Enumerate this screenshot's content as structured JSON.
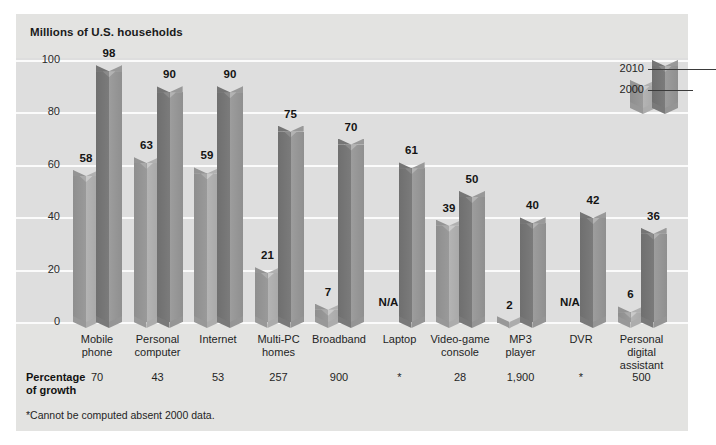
{
  "chart_data": {
    "type": "bar",
    "title": "Millions of U.S. households",
    "xlabel": "",
    "ylabel": "Millions of U.S. households",
    "ylim": [
      0,
      100
    ],
    "yticks": [
      0,
      20,
      40,
      60,
      80,
      100
    ],
    "grid": true,
    "legend_position": "top-right",
    "categories": [
      "Mobile\nphone",
      "Personal\ncomputer",
      "Internet",
      "Multi-PC\nhomes",
      "Broadband",
      "Laptop",
      "Video-game\nconsole",
      "MP3\nplayer",
      "DVR",
      "Personal\ndigital\nassistant"
    ],
    "series": [
      {
        "name": "2000",
        "values": [
          58,
          63,
          59,
          21,
          7,
          null,
          39,
          2,
          null,
          6
        ],
        "labels": [
          "58",
          "63",
          "59",
          "21",
          "7",
          "N/A",
          "39",
          "2",
          "N/A",
          "6"
        ]
      },
      {
        "name": "2010",
        "values": [
          98,
          90,
          90,
          75,
          70,
          61,
          50,
          40,
          42,
          36
        ],
        "labels": [
          "98",
          "90",
          "90",
          "75",
          "70",
          "61",
          "50",
          "40",
          "42",
          "36"
        ]
      }
    ],
    "growth_row_label": "Percentage\nof growth",
    "growth_values": [
      "70",
      "43",
      "53",
      "257",
      "900",
      "*",
      "28",
      "1,900",
      "*",
      "500"
    ],
    "footnote": "*Cannot be computed absent 2000 data."
  },
  "legend": {
    "items": [
      {
        "label": "2010",
        "series": "2010"
      },
      {
        "label": "2000",
        "series": "2000"
      }
    ]
  },
  "colors": {
    "panel_bg": "#e3e3e1",
    "plot_bg": "#dedede",
    "gridline": "#fbfbfb",
    "bar_2000_dark": "#8e8e8e",
    "bar_2000_light": "#b4b4b4",
    "bar_2010_dark": "#6f6f6f",
    "bar_2010_light": "#9d9d9d",
    "text": "#1a1a1a"
  }
}
